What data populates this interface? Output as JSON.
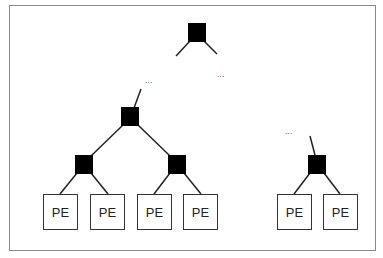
{
  "diagram": {
    "type": "tree-network",
    "colors": {
      "switch_node": "#000000",
      "edge": "#222222",
      "frame": "#8a8a8a",
      "pe_border": "#333333"
    },
    "ellipsis": [
      "...",
      "...",
      "..."
    ],
    "switch_nodes": [
      {
        "id": "root",
        "x": 188,
        "y": 23
      },
      {
        "id": "mid-left",
        "x": 121,
        "y": 107
      },
      {
        "id": "sub-a",
        "x": 75,
        "y": 155
      },
      {
        "id": "sub-b",
        "x": 168,
        "y": 155
      },
      {
        "id": "sub-c",
        "x": 308,
        "y": 155
      }
    ],
    "pe_boxes": [
      {
        "label": "PE",
        "x": 43,
        "y": 194
      },
      {
        "label": "PE",
        "x": 90,
        "y": 194
      },
      {
        "label": "PE",
        "x": 137,
        "y": 194
      },
      {
        "label": "PE",
        "x": 183,
        "y": 194
      },
      {
        "label": "PE",
        "x": 277,
        "y": 194
      },
      {
        "label": "PE",
        "x": 323,
        "y": 194
      }
    ]
  }
}
